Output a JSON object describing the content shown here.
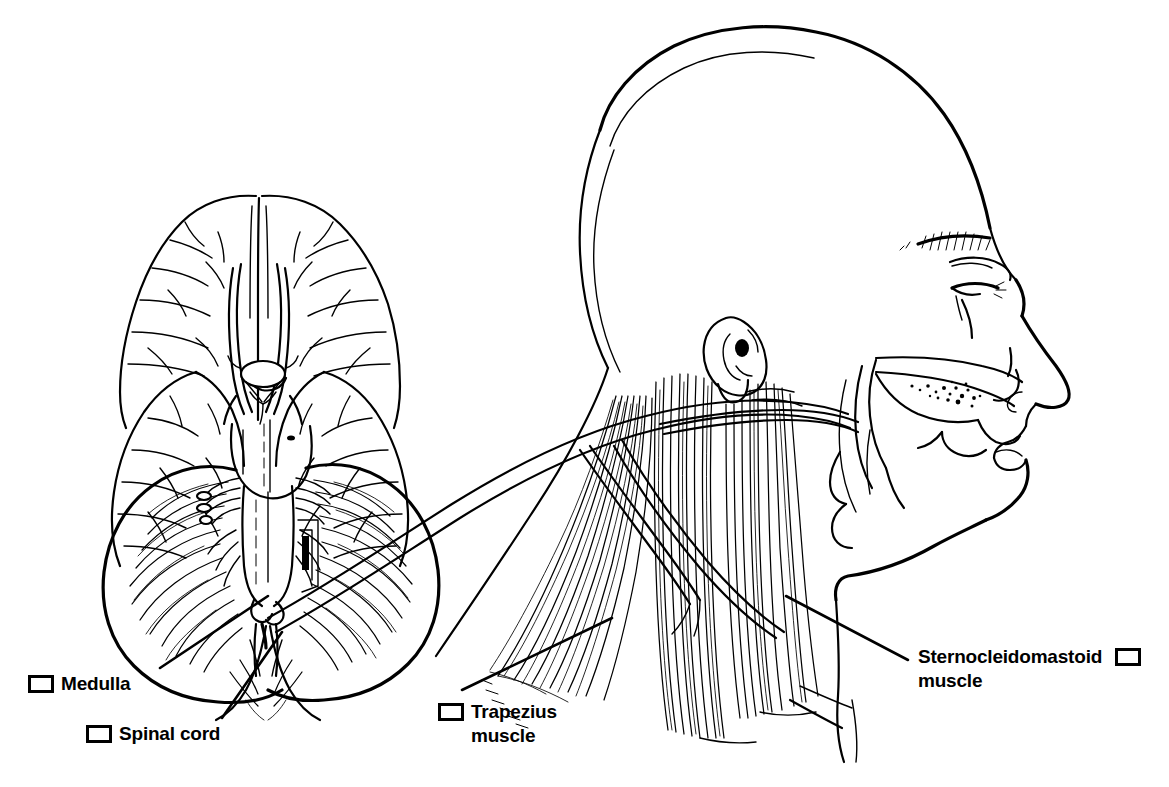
{
  "figure": {
    "kind": "anatomical-line-drawing",
    "background_color": "#ffffff",
    "ink_color": "#000000",
    "width": 1169,
    "height": 787
  },
  "labels": [
    {
      "id": "medulla",
      "text": "Medulla",
      "line2": "",
      "checkbox_side": "left",
      "checked": false
    },
    {
      "id": "spinal-cord",
      "text": "Spinal cord",
      "line2": "",
      "checkbox_side": "left",
      "checked": false
    },
    {
      "id": "trapezius",
      "text": "Trapezius",
      "line2": "muscle",
      "checkbox_side": "left",
      "checked": false
    },
    {
      "id": "sternocleidomastoid",
      "text": "Sternocleidomastoid",
      "line2": "muscle",
      "checkbox_side": "right",
      "checked": false
    }
  ],
  "structures": [
    "cerebral hemispheres (inferior view)",
    "temporal lobes",
    "optic chiasm",
    "pons",
    "cerebellum",
    "medulla oblongata",
    "spinal cord",
    "accessory nerve trunk",
    "head profile",
    "ear (auricle)",
    "eye and eyebrow",
    "nose",
    "nasal cavity",
    "hard palate",
    "tongue",
    "lips",
    "chin and jaw",
    "sternocleidomastoid muscle fibers",
    "trapezius muscle fibers"
  ]
}
